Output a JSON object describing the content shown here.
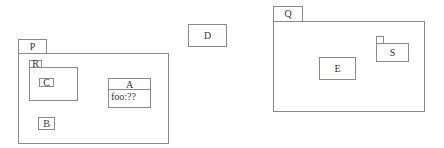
{
  "diagram": {
    "packages": [
      {
        "id": "P",
        "label": "P"
      },
      {
        "id": "R",
        "label": "R"
      },
      {
        "id": "Q",
        "label": "Q"
      },
      {
        "id": "S",
        "label": "S"
      }
    ],
    "boxes": {
      "C": "C",
      "B": "B",
      "D": "D",
      "E": "E"
    },
    "class_A": {
      "name": "A",
      "attributes": [
        "foo:??"
      ]
    },
    "colors": {
      "line": "#8a8a8a",
      "text": "#333333",
      "background": "#ffffff"
    }
  }
}
